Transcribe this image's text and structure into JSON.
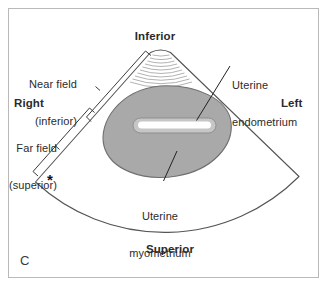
{
  "figure": {
    "panel_letter": "C",
    "modality": "transverse pelvic ultrasound schematic",
    "frame_color": "#b9b9b9",
    "background_color": "#ffffff"
  },
  "orientation_labels": {
    "top": "Inferior",
    "bottom": "Superior",
    "left": "Right",
    "right": "Left"
  },
  "field_brackets": [
    {
      "id": "near-field",
      "line1": "Near field",
      "line2": "(inferior)"
    },
    {
      "id": "far-field",
      "line1": "Far field",
      "line2": "(superior)"
    }
  ],
  "markers": {
    "asterisk": "*"
  },
  "annotations": [
    {
      "id": "uterine-endometrium",
      "line1": "Uterine",
      "line2": "endometrium",
      "target": "central echogenic stripe"
    },
    {
      "id": "uterine-myometrium",
      "line1": "Uterine",
      "line2": "myometrium",
      "target": "gray uterine body"
    }
  ],
  "structures": {
    "sector_fan": {
      "name": "ultrasound sector scan field",
      "stroke": "#4a4a4a",
      "fill": "#ffffff"
    },
    "near_field_arcs": {
      "name": "near-field reverberation arcs",
      "count": 9,
      "stroke": "#9b9b9b"
    },
    "myometrium": {
      "name": "uterine myometrium",
      "fill": "#a9a9a9",
      "stroke": "#6e6e6e"
    },
    "endometrium": {
      "name": "uterine endometrial stripe",
      "fill": "#ffffff",
      "stroke": "#8c8c8c",
      "halo_fill": "#c4c4c4"
    }
  }
}
